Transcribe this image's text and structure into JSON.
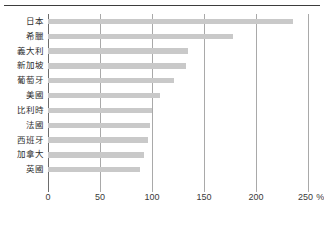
{
  "figure": {
    "title_remnant": "",
    "x_unit": "%"
  },
  "chart_data": {
    "type": "bar",
    "orientation": "horizontal",
    "title": "",
    "subtitle": "",
    "xlabel": "%",
    "ylabel": "",
    "xlim": [
      0,
      250
    ],
    "xticks": [
      0,
      50,
      100,
      150,
      200,
      250
    ],
    "xtick_labels": [
      "0",
      "50",
      "100",
      "150",
      "200",
      "250"
    ],
    "x_unit_suffix": "%",
    "grid": "vertical",
    "legend": "none",
    "bar_color": "#c9c9c9",
    "axis_color": "#6d6d6d",
    "gridline_color": "#a9a9a9",
    "categories": [
      "日本",
      "希臘",
      "義大利",
      "新加坡",
      "葡萄牙",
      "美國",
      "比利時",
      "法國",
      "西班牙",
      "加拿大",
      "英國"
    ],
    "values": [
      236,
      178,
      135,
      133,
      121,
      108,
      100,
      98,
      96,
      92,
      88
    ],
    "series": [
      {
        "name": "",
        "values": [
          236,
          178,
          135,
          133,
          121,
          108,
          100,
          98,
          96,
          92,
          88
        ]
      }
    ]
  }
}
